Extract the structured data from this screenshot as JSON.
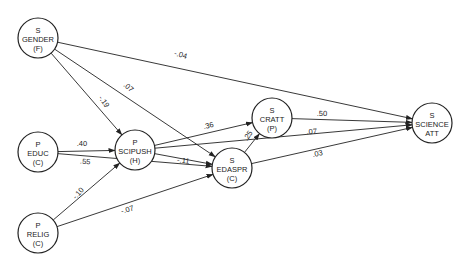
{
  "diagram": {
    "type": "path-diagram",
    "nodes": [
      {
        "id": "gender",
        "lines": [
          "S",
          "GENDER",
          "(F)"
        ],
        "x": 38,
        "y": 38
      },
      {
        "id": "educ",
        "lines": [
          "P",
          "EDUC",
          "(C)"
        ],
        "x": 38,
        "y": 152
      },
      {
        "id": "relig",
        "lines": [
          "P",
          "RELIG",
          "(C)"
        ],
        "x": 38,
        "y": 233
      },
      {
        "id": "scipush",
        "lines": [
          "P",
          "SCIPUSH",
          "(H)"
        ],
        "x": 135,
        "y": 150
      },
      {
        "id": "cratt",
        "lines": [
          "S",
          "CRATT",
          "(P)"
        ],
        "x": 272,
        "y": 118
      },
      {
        "id": "edaspr",
        "lines": [
          "S",
          "EDASPR",
          "(C)"
        ],
        "x": 232,
        "y": 168
      },
      {
        "id": "science_att",
        "lines": [
          "S",
          "SCIENCE",
          "ATT"
        ],
        "x": 432,
        "y": 123
      }
    ],
    "edges": [
      {
        "from": "gender",
        "to": "science_att",
        "label": "-.04",
        "lx": 180,
        "ly": 57,
        "rot": 16
      },
      {
        "from": "gender",
        "to": "scipush",
        "label": "-.19",
        "lx": 102,
        "ly": 103,
        "rot": 55
      },
      {
        "from": "gender",
        "to": "edaspr",
        "label": ".07",
        "lx": 127,
        "ly": 89,
        "rot": 40
      },
      {
        "from": "educ",
        "to": "scipush",
        "label": ".40",
        "lx": 82,
        "ly": 146,
        "rot": 0
      },
      {
        "from": "educ",
        "to": "edaspr",
        "label": ".55",
        "lx": 85,
        "ly": 164,
        "rot": 5
      },
      {
        "from": "relig",
        "to": "scipush",
        "label": "-.10",
        "lx": 80,
        "ly": 195,
        "rot": -48
      },
      {
        "from": "relig",
        "to": "edaspr",
        "label": "-.07",
        "lx": 128,
        "ly": 212,
        "rot": -16
      },
      {
        "from": "scipush",
        "to": "cratt",
        "label": ".36",
        "lx": 209,
        "ly": 128,
        "rot": -14
      },
      {
        "from": "scipush",
        "to": "science_att",
        "label": ".07",
        "lx": 312,
        "ly": 134,
        "rot": -4
      },
      {
        "from": "scipush",
        "to": "edaspr",
        "label": "-.11",
        "lx": 183,
        "ly": 163,
        "rot": 8
      },
      {
        "from": "edaspr",
        "to": "cratt",
        "label": ".25",
        "lx": 250,
        "ly": 137,
        "rot": -55
      },
      {
        "from": "cratt",
        "to": "science_att",
        "label": ".50",
        "lx": 322,
        "ly": 116,
        "rot": 1
      },
      {
        "from": "edaspr",
        "to": "science_att",
        "label": ".03",
        "lx": 318,
        "ly": 156,
        "rot": -12
      }
    ],
    "node_radius": 20
  }
}
